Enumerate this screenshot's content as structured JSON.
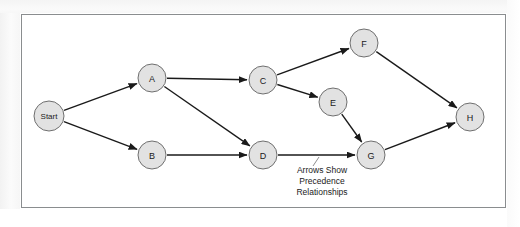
{
  "figure": {
    "type": "precedence-network-diagram",
    "frame": {
      "x": 21,
      "y": 14,
      "width": 485,
      "height": 194
    },
    "colors": {
      "node_fill": "#e2e2e2",
      "node_stroke": "#6f6f6f",
      "edge": "#1a1a1a",
      "frame_border": "#8a8d8f",
      "background": "#ffffff",
      "leader_line": "#8e8e8e",
      "text": "#1a1a1a"
    }
  },
  "nodes": [
    {
      "id": "start",
      "label": "Start",
      "x": 49,
      "y": 116,
      "r": 15
    },
    {
      "id": "a",
      "label": "A",
      "x": 152,
      "y": 78,
      "r": 14
    },
    {
      "id": "b",
      "label": "B",
      "x": 152,
      "y": 155,
      "r": 14
    },
    {
      "id": "c",
      "label": "C",
      "x": 263,
      "y": 80,
      "r": 14
    },
    {
      "id": "d",
      "label": "D",
      "x": 263,
      "y": 155,
      "r": 14
    },
    {
      "id": "e",
      "label": "E",
      "x": 333,
      "y": 102,
      "r": 14
    },
    {
      "id": "f",
      "label": "F",
      "x": 364,
      "y": 43,
      "r": 14
    },
    {
      "id": "g",
      "label": "G",
      "x": 371,
      "y": 155,
      "r": 14
    },
    {
      "id": "h",
      "label": "H",
      "x": 470,
      "y": 117,
      "r": 14
    }
  ],
  "edges": [
    {
      "from": "start",
      "to": "a"
    },
    {
      "from": "start",
      "to": "b"
    },
    {
      "from": "a",
      "to": "c"
    },
    {
      "from": "a",
      "to": "d"
    },
    {
      "from": "b",
      "to": "d"
    },
    {
      "from": "c",
      "to": "f"
    },
    {
      "from": "c",
      "to": "e"
    },
    {
      "from": "d",
      "to": "g"
    },
    {
      "from": "e",
      "to": "g"
    },
    {
      "from": "f",
      "to": "h"
    },
    {
      "from": "g",
      "to": "h"
    }
  ],
  "annotation": {
    "lines": [
      "Arrows Show",
      "Precedence",
      "Relationships"
    ],
    "x": 322,
    "line_y": [
      173,
      184,
      195
    ],
    "leader": {
      "x1": 313,
      "y1": 166,
      "x2": 319,
      "y2": 157
    }
  }
}
